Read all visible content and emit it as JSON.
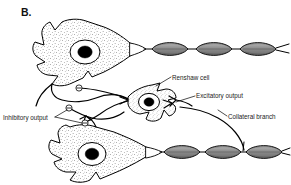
{
  "figure": {
    "panel_letter": "B.",
    "caption_absent": true,
    "background_color": "#ffffff",
    "ink_color": "#000000",
    "myelin_color": "#8d8d8d"
  },
  "annotations": [
    {
      "id": "renshaw-cell",
      "label": "Renshaw cell",
      "text_x": 172,
      "text_y": 80,
      "anchor": "start",
      "leader": "M 171 77 L 156 86"
    },
    {
      "id": "excitatory-output",
      "label": "Excitatory output",
      "text_x": 196,
      "text_y": 98,
      "anchor": "start",
      "leader": "M 195 96 L 176 102"
    },
    {
      "id": "collateral-branch",
      "label": "Collateral branch",
      "text_x": 228,
      "text_y": 119,
      "anchor": "start",
      "leader": "M 227 116 L 219 111"
    },
    {
      "id": "inhibitory-output",
      "label": "Inhibitory output",
      "text_x": 3,
      "text_y": 120,
      "anchor": "start",
      "leader": "M 54 118 L 68 110 M 54 118 L 84 123"
    }
  ],
  "cells": [
    {
      "id": "motor-neuron-top",
      "type": "alpha motor neuron",
      "soma_center_x": 85,
      "soma_center_y": 50,
      "nucleus": true
    },
    {
      "id": "renshaw-interneuron",
      "type": "Renshaw cell",
      "soma_center_x": 145,
      "soma_center_y": 102,
      "nucleus": true
    },
    {
      "id": "motor-neuron-bottom",
      "type": "alpha motor neuron",
      "soma_center_x": 92,
      "soma_center_y": 150,
      "nucleus": true
    }
  ],
  "axons": [
    {
      "id": "axon-top",
      "myelin_segment_count": 3,
      "direction": "rightward"
    },
    {
      "id": "axon-bottom",
      "myelin_segment_count": 3,
      "direction": "rightward"
    }
  ],
  "synapses": [
    {
      "id": "synapse-inhibitory-1",
      "symbol": "−",
      "cx": 79,
      "cy": 88
    },
    {
      "id": "synapse-inhibitory-2",
      "symbol": "−",
      "cx": 69,
      "cy": 108
    },
    {
      "id": "synapse-inhibitory-3",
      "symbol": "−",
      "cx": 85,
      "cy": 123
    }
  ]
}
